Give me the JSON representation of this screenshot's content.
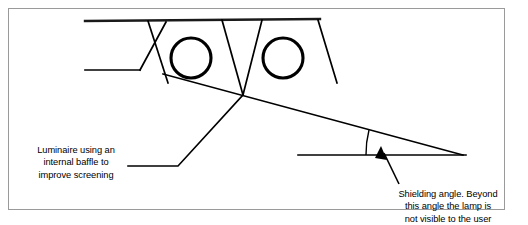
{
  "figure": {
    "background_color": "#ffffff",
    "border_color": "#9a9a9a",
    "line_color": "#000000"
  },
  "labels": {
    "left": {
      "text": "Luminaire using an\ninternal baffle to\nimprove screening",
      "line1": "Luminaire using an",
      "line2": "internal baffle to",
      "line3": "improve screening"
    },
    "right": {
      "text": "Shielding angle. Beyond\nthis angle the lamp is\nnot visible to the user",
      "line1": "Shielding angle. Beyond",
      "line2": "this angle the lamp is",
      "line3": "not visible to the user"
    }
  },
  "diagram": {
    "ceiling_line": {
      "x1": 85,
      "y1": 21,
      "x2": 320,
      "y2": 19
    },
    "luminaire_left_edge": {
      "x1": 85,
      "y1": 70,
      "x2": 140,
      "y2": 70
    },
    "luminaire_left_slant": {
      "x1": 140,
      "y1": 70,
      "x2": 165,
      "y2": 22
    },
    "luminaire_right_slant": {
      "x1": 318,
      "y1": 20,
      "x2": 337,
      "y2": 83
    },
    "baffle_left_outer": {
      "x1": 148,
      "y1": 21,
      "x2": 168,
      "y2": 83
    },
    "baffle_center_left": {
      "x1": 222,
      "y1": 20,
      "x2": 243,
      "y2": 95
    },
    "baffle_center_right": {
      "x1": 262,
      "y1": 20,
      "x2": 243,
      "y2": 95
    },
    "lamps": [
      {
        "cx": 191,
        "cy": 58,
        "r": 20
      },
      {
        "cx": 283,
        "cy": 58,
        "r": 20
      }
    ],
    "sight_line": {
      "x1": 163,
      "y1": 74,
      "x2": 462,
      "y2": 155
    },
    "horizontal_reference_line": {
      "x1": 298,
      "y1": 155,
      "x2": 465,
      "y2": 155
    },
    "angle_arc": {
      "vertex_x": 462,
      "vertex_y": 155,
      "radius": 96,
      "angle_degrees": 15
    },
    "leader_left": {
      "x1": 128,
      "y1": 166,
      "x2": 178,
      "y2": 166,
      "x3": 243,
      "y3": 95
    },
    "arrow_right": {
      "from_x": 399,
      "from_y": 184,
      "to_x": 381,
      "to_y": 147
    }
  }
}
